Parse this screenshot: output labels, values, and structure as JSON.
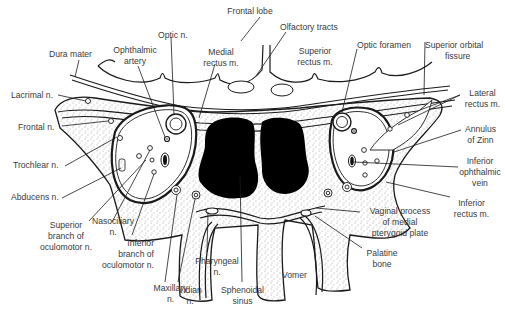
{
  "diagram": {
    "type": "anatomical-cross-section",
    "colors": {
      "ink": "#1a1a1a",
      "stipple": "#555555",
      "label": "#3a3a3a",
      "sinus": "#000000",
      "background": "#ffffff"
    }
  },
  "labels": {
    "frontal_lobe": "Frontal lobe",
    "olfactory_tracts": "Olfactory tracts",
    "optic_n": "Optic n.",
    "dura_mater": "Dura mater",
    "ophthalmic_artery_1": "Ophthalmic",
    "ophthalmic_artery_2": "artery",
    "medial_rectus_1": "Medial",
    "medial_rectus_2": "rectus m.",
    "superior_rectus_1": "Superior",
    "superior_rectus_2": "rectus m.",
    "optic_foramen": "Optic foramen",
    "superior_orbital_fissure_1": "Superior orbital",
    "superior_orbital_fissure_2": "fissure",
    "lacrimal_n": "Lacrimal n.",
    "lateral_rectus_1": "Lateral",
    "lateral_rectus_2": "rectus m.",
    "frontal_n": "Frontal n.",
    "annulus_zinn_1": "Annulus",
    "annulus_zinn_2": "of Zinn",
    "trochlear_n": "Trochlear n.",
    "inferior_ophthalmic_vein_1": "Inferior",
    "inferior_ophthalmic_vein_2": "ophthalmic",
    "inferior_ophthalmic_vein_3": "vein",
    "abducens_n": "Abducens n.",
    "inferior_rectus_1": "Inferior",
    "inferior_rectus_2": "rectus m.",
    "nasociliary_1": "Nasociliary",
    "nasociliary_2": "n.",
    "superior_branch_1": "Superior",
    "superior_branch_2": "branch of",
    "superior_branch_3": "oculomotor n.",
    "inferior_branch_1": "Inferior",
    "inferior_branch_2": "branch of",
    "inferior_branch_3": "oculomotor n.",
    "vaginal_process_1": "Vaginal process",
    "vaginal_process_2": "of medial",
    "vaginal_process_3": "pterygoid plate",
    "palatine_bone_1": "Palatine",
    "palatine_bone_2": "bone",
    "pharyngeal_1": "Pharyngeal",
    "pharyngeal_2": "n.",
    "vomer": "Vomer",
    "maxillary_1": "Maxillary",
    "maxillary_2": "n.",
    "vidian_1": "Vidian",
    "vidian_2": "n.",
    "sphenoidal_sinus_1": "Sphenoidal",
    "sphenoidal_sinus_2": "sinus"
  }
}
